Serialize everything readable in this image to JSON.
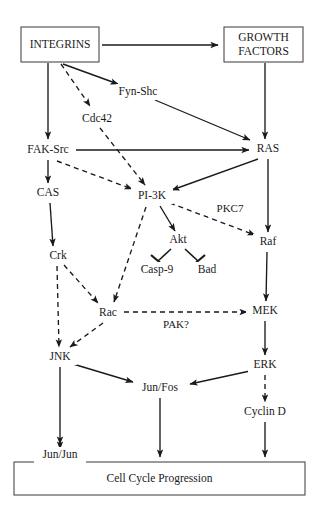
{
  "figure": {
    "type": "signaling-pathway-diagram",
    "background_color": "#ffffff",
    "line_color": "#1a1a1a",
    "box_stroke_color": "#4a4a4a",
    "width": 318,
    "height": 516
  },
  "boxes": {
    "integrins": {
      "label": "INTEGRINS",
      "x": 21,
      "y": 27,
      "w": 78,
      "h": 35
    },
    "growth_factors": {
      "line1": "GROWTH",
      "line2": "FACTORS",
      "x": 224,
      "y": 27,
      "w": 79,
      "h": 35
    },
    "cell_cycle": {
      "label": "Cell Cycle Progression",
      "x": 14,
      "y": 462,
      "w": 291,
      "h": 33
    }
  },
  "nodes": [
    {
      "id": "fyn_shc",
      "label": "Fyn-Shc",
      "x": 138,
      "y": 92
    },
    {
      "id": "cdc42",
      "label": "Cdc42",
      "x": 97,
      "y": 119
    },
    {
      "id": "fak_src",
      "label": "FAK-Src",
      "x": 48,
      "y": 150
    },
    {
      "id": "ras",
      "label": "RAS",
      "x": 268,
      "y": 149
    },
    {
      "id": "cas",
      "label": "CAS",
      "x": 48,
      "y": 193
    },
    {
      "id": "pi3k",
      "label": "PI-3K",
      "x": 152,
      "y": 196
    },
    {
      "id": "pkc7",
      "label": "PKC7",
      "x": 230,
      "y": 209
    },
    {
      "id": "akt",
      "label": "Akt",
      "x": 178,
      "y": 240
    },
    {
      "id": "raf",
      "label": "Raf",
      "x": 268,
      "y": 242
    },
    {
      "id": "crk",
      "label": "Crk",
      "x": 58,
      "y": 256
    },
    {
      "id": "casp9",
      "label": "Casp-9",
      "x": 157,
      "y": 270
    },
    {
      "id": "bad",
      "label": "Bad",
      "x": 207,
      "y": 270
    },
    {
      "id": "rac",
      "label": "Rac",
      "x": 108,
      "y": 313
    },
    {
      "id": "mek",
      "label": "MEK",
      "x": 265,
      "y": 311
    },
    {
      "id": "pak",
      "label": "PAK?",
      "x": 176,
      "y": 325
    },
    {
      "id": "jnk",
      "label": "JNK",
      "x": 60,
      "y": 357
    },
    {
      "id": "erk",
      "label": "ERK",
      "x": 265,
      "y": 365
    },
    {
      "id": "jun_fos",
      "label": "Jun/Fos",
      "x": 160,
      "y": 388
    },
    {
      "id": "cyclin_d",
      "label": "Cyclin D",
      "x": 265,
      "y": 412
    },
    {
      "id": "jun_jun",
      "label": "Jun/Jun",
      "x": 60,
      "y": 455
    }
  ],
  "edges": [
    {
      "from": "integrins",
      "to": "growth_factors",
      "style": "solid",
      "head": "arrow"
    },
    {
      "from": "integrins",
      "to": "fak_src",
      "style": "solid",
      "head": "arrow"
    },
    {
      "from": "integrins",
      "to": "cdc42",
      "style": "dashed",
      "head": "arrow"
    },
    {
      "from": "integrins",
      "to": "fyn_shc",
      "style": "solid",
      "head": "arrow"
    },
    {
      "from": "growth_factors",
      "to": "ras",
      "style": "solid",
      "head": "arrow"
    },
    {
      "from": "fyn_shc",
      "to": "ras",
      "style": "solid",
      "head": "arrow"
    },
    {
      "from": "cdc42",
      "to": "pi3k",
      "style": "dashed",
      "head": "arrow"
    },
    {
      "from": "fak_src",
      "to": "ras",
      "style": "solid",
      "head": "arrow"
    },
    {
      "from": "fak_src",
      "to": "cas",
      "style": "solid",
      "head": "arrow"
    },
    {
      "from": "fak_src",
      "to": "pi3k",
      "style": "dashed",
      "head": "arrow"
    },
    {
      "from": "ras",
      "to": "pi3k",
      "style": "solid",
      "head": "arrow"
    },
    {
      "from": "ras",
      "to": "raf",
      "style": "solid",
      "head": "arrow"
    },
    {
      "from": "cas",
      "to": "crk",
      "style": "solid",
      "head": "arrow"
    },
    {
      "from": "pi3k",
      "to": "akt",
      "style": "solid",
      "head": "arrow"
    },
    {
      "from": "pi3k",
      "to": "rac",
      "style": "dashed",
      "head": "arrow"
    },
    {
      "from": "pi3k",
      "to": "raf",
      "style": "dashed",
      "head": "arrow",
      "label": "PKC7"
    },
    {
      "from": "akt",
      "to": "casp9",
      "style": "solid",
      "head": "inhibit"
    },
    {
      "from": "akt",
      "to": "bad",
      "style": "solid",
      "head": "inhibit"
    },
    {
      "from": "raf",
      "to": "mek",
      "style": "solid",
      "head": "arrow"
    },
    {
      "from": "crk",
      "to": "rac",
      "style": "dashed",
      "head": "arrow"
    },
    {
      "from": "crk",
      "to": "jnk",
      "style": "dashed",
      "head": "arrow"
    },
    {
      "from": "rac",
      "to": "mek",
      "style": "dashed",
      "head": "arrow",
      "label": "PAK?"
    },
    {
      "from": "rac",
      "to": "jnk",
      "style": "dashed",
      "head": "arrow"
    },
    {
      "from": "mek",
      "to": "erk",
      "style": "solid",
      "head": "arrow"
    },
    {
      "from": "jnk",
      "to": "jun_fos",
      "style": "solid",
      "head": "arrow"
    },
    {
      "from": "jnk",
      "to": "jun_jun",
      "style": "solid",
      "head": "arrow"
    },
    {
      "from": "erk",
      "to": "jun_fos",
      "style": "solid",
      "head": "arrow"
    },
    {
      "from": "erk",
      "to": "cyclin_d",
      "style": "dashed",
      "head": "arrow"
    },
    {
      "from": "jun_fos",
      "to": "cell_cycle",
      "style": "solid",
      "head": "arrow"
    },
    {
      "from": "cyclin_d",
      "to": "cell_cycle",
      "style": "solid",
      "head": "arrow"
    },
    {
      "from": "jun_jun",
      "to": "cell_cycle",
      "style": "solid",
      "head": "arrow"
    }
  ]
}
